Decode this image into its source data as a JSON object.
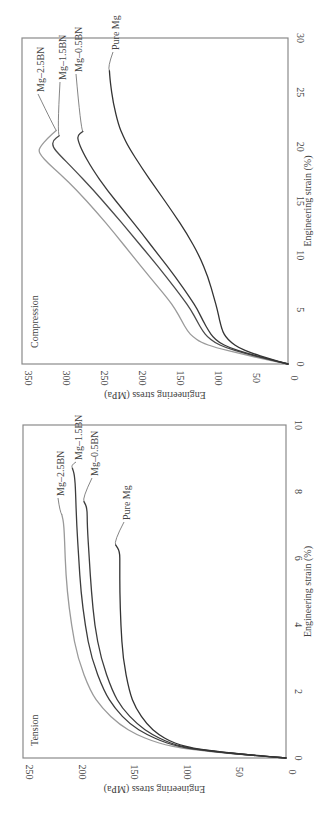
{
  "chart_data": [
    {
      "type": "line",
      "title": "Compression",
      "xlabel": "Engineering strain (%)",
      "ylabel": "Engineering stress (MPa)",
      "xlim": [
        0,
        30
      ],
      "ylim": [
        0,
        350
      ],
      "xticks": [
        "0",
        "5",
        "10",
        "15",
        "20",
        "25",
        "30"
      ],
      "yticks": [
        "0",
        "50",
        "100",
        "150",
        "200",
        "250",
        "300",
        "350"
      ],
      "grid": false,
      "orientation": "rotated-90-counterclockwise",
      "series": [
        {
          "name": "Mg–2.5BN",
          "color": "#9a9a9a",
          "x": [
            0,
            0.5,
            1.0,
            1.5,
            2.0,
            2.5,
            3.0,
            4.0,
            5.0,
            6.0,
            8.0,
            10.0,
            12.0,
            14.0,
            16.0,
            17.5,
            18.5,
            19.2,
            19.6,
            20.0,
            20.8,
            21.5
          ],
          "y": [
            0,
            35,
            65,
            95,
            115,
            125,
            132,
            140,
            148,
            158,
            182,
            205,
            228,
            252,
            278,
            300,
            316,
            325,
            328,
            326,
            316,
            305
          ]
        },
        {
          "name": "Mg–1.5BN",
          "color": "#4a4a4a",
          "x": [
            0,
            0.5,
            1.0,
            1.5,
            2.0,
            2.5,
            3.0,
            4.0,
            5.0,
            6.0,
            8.0,
            10.0,
            12.0,
            14.0,
            16.0,
            18.0,
            19.2,
            20.0,
            20.6,
            21.0
          ],
          "y": [
            0,
            30,
            58,
            82,
            97,
            106,
            112,
            120,
            128,
            138,
            160,
            183,
            207,
            231,
            256,
            283,
            300,
            310,
            309,
            301
          ]
        },
        {
          "name": "Mg–0.5BN",
          "color": "#3a3a3a",
          "x": [
            0,
            0.5,
            1.0,
            1.5,
            2.0,
            2.5,
            3.0,
            4.0,
            5.0,
            6.0,
            8.0,
            10.0,
            12.0,
            14.0,
            16.0,
            18.0,
            19.5,
            20.5,
            21.0,
            21.4
          ],
          "y": [
            0,
            28,
            55,
            77,
            91,
            99,
            104,
            112,
            119,
            128,
            148,
            170,
            192,
            215,
            238,
            258,
            270,
            276,
            277,
            270
          ]
        },
        {
          "name": "Pure Mg",
          "color": "#333333",
          "x": [
            0,
            0.5,
            1.0,
            1.5,
            2.0,
            2.5,
            3.0,
            3.5,
            4.0,
            5.0,
            6.0,
            8.0,
            10.0,
            12.0,
            14.0,
            16.0,
            18.0,
            20.0,
            21.0,
            22.0,
            24.0,
            26.0,
            27.0
          ],
          "y": [
            0,
            25,
            48,
            65,
            75,
            82,
            86,
            88,
            90,
            93,
            97,
            105,
            117,
            133,
            152,
            172,
            192,
            210,
            217,
            223,
            230,
            234,
            235
          ]
        }
      ],
      "annotations": [
        {
          "text": "Compression",
          "position": "top-left"
        },
        {
          "text": "Mg–2.5BN",
          "series": "Mg–2.5BN"
        },
        {
          "text": "Mg–1.5BN",
          "series": "Mg–1.5BN"
        },
        {
          "text": "Mg–0.5BN",
          "series": "Mg–0.5BN"
        },
        {
          "text": "Pure Mg",
          "series": "Pure Mg"
        }
      ]
    },
    {
      "type": "line",
      "title": "Tension",
      "xlabel": "Engineering strain (%)",
      "ylabel": "Engineering stress (MPa)",
      "xlim": [
        0,
        10
      ],
      "ylim": [
        0,
        250
      ],
      "xticks": [
        "0",
        "2",
        "4",
        "6",
        "8",
        "10"
      ],
      "yticks": [
        "0",
        "50",
        "100",
        "150",
        "200",
        "250"
      ],
      "grid": false,
      "orientation": "rotated-90-counterclockwise",
      "series": [
        {
          "name": "Mg–2.5BN",
          "color": "#9a9a9a",
          "x": [
            0,
            0.1,
            0.2,
            0.3,
            0.4,
            0.5,
            0.7,
            1.0,
            1.5,
            2.0,
            3.0,
            4.0,
            5.0,
            6.0,
            7.0,
            7.3
          ],
          "y": [
            0,
            40,
            75,
            100,
            115,
            126,
            142,
            158,
            175,
            186,
            198,
            204,
            208,
            210,
            211,
            213
          ]
        },
        {
          "name": "Mg–1.5BN",
          "color": "#3c3c3c",
          "x": [
            0,
            0.1,
            0.2,
            0.3,
            0.4,
            0.5,
            0.7,
            1.0,
            1.5,
            2.0,
            3.0,
            4.0,
            5.0,
            6.0,
            7.0,
            8.0,
            8.5,
            8.7
          ],
          "y": [
            0,
            38,
            72,
            95,
            108,
            118,
            132,
            148,
            163,
            173,
            185,
            191,
            195,
            197,
            199,
            200,
            201,
            203
          ]
        },
        {
          "name": "Mg–0.5BN",
          "color": "#3c3c3c",
          "x": [
            0,
            0.1,
            0.2,
            0.3,
            0.4,
            0.5,
            0.7,
            1.0,
            1.5,
            2.0,
            3.0,
            4.0,
            5.0,
            6.0,
            7.0,
            7.5,
            7.7
          ],
          "y": [
            0,
            38,
            70,
            92,
            105,
            114,
            127,
            141,
            156,
            165,
            176,
            182,
            185,
            187,
            189,
            189,
            192
          ]
        },
        {
          "name": "Pure Mg",
          "color": "#333333",
          "x": [
            0,
            0.1,
            0.2,
            0.3,
            0.4,
            0.5,
            0.7,
            1.0,
            1.5,
            2.0,
            3.0,
            4.0,
            5.0,
            5.8,
            6.2,
            6.4
          ],
          "y": [
            0,
            36,
            68,
            89,
            101,
            110,
            121,
            132,
            143,
            149,
            155,
            157,
            158,
            158,
            158,
            162
          ]
        }
      ],
      "annotations": [
        {
          "text": "Tension",
          "position": "top-left"
        },
        {
          "text": "Mg–2.5BN",
          "series": "Mg–2.5BN"
        },
        {
          "text": "Mg–1.5BN",
          "series": "Mg–1.5BN"
        },
        {
          "text": "Mg–0.5BN",
          "series": "Mg–0.5BN"
        },
        {
          "text": "Pure Mg",
          "series": "Pure Mg"
        }
      ]
    }
  ],
  "frame_color": "#8a8a8a"
}
